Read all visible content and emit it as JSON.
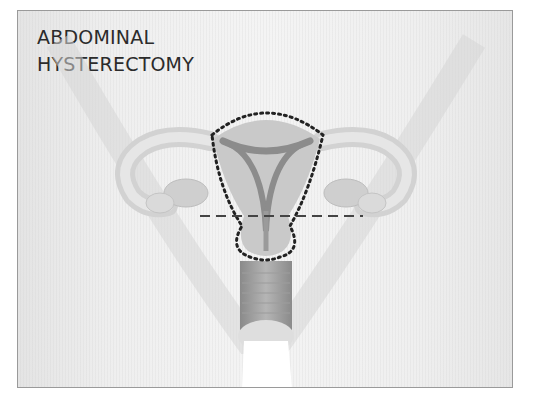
{
  "figure": {
    "title_lines": [
      "ABDOMINAL",
      "HYSTERECTOMY"
    ],
    "annotations": {
      "excision_outline": "dotted",
      "cut_line": "dashed"
    },
    "colors": {
      "background": "#efefef",
      "frame_border": "#9a9a9a",
      "organ_fill": "#c9c9c9",
      "organ_light": "#dcdcdc",
      "cavity": "#8c8c8c",
      "outline": "#222222",
      "text": "#2b2b2b"
    }
  }
}
